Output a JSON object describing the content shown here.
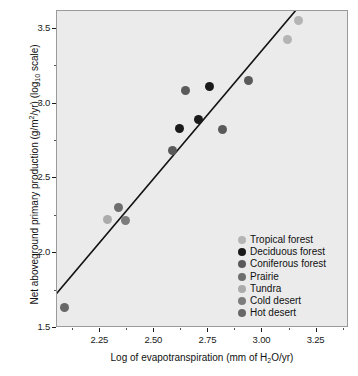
{
  "chart_data": {
    "type": "scatter",
    "title": "",
    "xlabel": "Log of evapotranspiration (mm of H2O/yr)",
    "ylabel": "Net aboveground primary production (g/m2/yr) (log10 scale)",
    "xlim": [
      2.05,
      3.4
    ],
    "ylim": [
      1.5,
      3.62
    ],
    "xticks": [
      "2.25",
      "2.50",
      "2.75",
      "3.00",
      "3.25"
    ],
    "xtick_values": [
      2.25,
      2.5,
      2.75,
      3.0,
      3.25
    ],
    "yticks": [
      "1.5",
      "2.0",
      "2.5",
      "3.0",
      "3.5"
    ],
    "ytick_values": [
      1.5,
      2.0,
      2.5,
      3.0,
      3.5
    ],
    "grid": false,
    "legend_position": "lower-right-inside",
    "trendline": {
      "type": "linear",
      "x_start": 2.05,
      "y_start": 1.72,
      "x_end": 3.16,
      "y_end": 3.62
    },
    "series": [
      {
        "name": "Tropical forest",
        "color": "#b4b4b4",
        "points": [
          {
            "x": 3.12,
            "y": 3.42
          },
          {
            "x": 3.17,
            "y": 3.55
          }
        ]
      },
      {
        "name": "Deciduous forest",
        "color": "#1a1a1a",
        "points": [
          {
            "x": 2.62,
            "y": 2.83
          },
          {
            "x": 2.71,
            "y": 2.89
          },
          {
            "x": 2.76,
            "y": 3.11
          }
        ]
      },
      {
        "name": "Coniferous forest",
        "color": "#5a5a5a",
        "points": [
          {
            "x": 2.59,
            "y": 2.68
          },
          {
            "x": 2.65,
            "y": 3.08
          },
          {
            "x": 2.82,
            "y": 2.82
          },
          {
            "x": 2.94,
            "y": 3.15
          }
        ]
      },
      {
        "name": "Prairie",
        "color": "#6e6e6e",
        "points": [
          {
            "x": 2.34,
            "y": 2.3
          }
        ]
      },
      {
        "name": "Tundra",
        "color": "#ababab",
        "points": [
          {
            "x": 2.29,
            "y": 2.22
          }
        ]
      },
      {
        "name": "Cold desert",
        "color": "#7c7c7c",
        "points": [
          {
            "x": 2.37,
            "y": 2.21
          }
        ]
      },
      {
        "name": "Hot desert",
        "color": "#686868",
        "points": [
          {
            "x": 2.09,
            "y": 1.63
          }
        ]
      }
    ]
  },
  "axes": {
    "x_title_parts": {
      "pre": "Log of evapotranspiration (mm of H",
      "sub": "2",
      "post": "O/yr)"
    },
    "y_title_parts": {
      "pre": "Net aboveground primary production (g/m",
      "sup": "2",
      "mid": "/yr) (log",
      "sub": "10",
      "post": " scale)"
    }
  },
  "legend": {
    "items": [
      {
        "label": "Tropical forest",
        "color": "#b4b4b4"
      },
      {
        "label": "Deciduous forest",
        "color": "#1a1a1a"
      },
      {
        "label": "Coniferous forest",
        "color": "#5a5a5a"
      },
      {
        "label": "Prairie",
        "color": "#6e6e6e"
      },
      {
        "label": "Tundra",
        "color": "#ababab"
      },
      {
        "label": "Cold desert",
        "color": "#7c7c7c"
      },
      {
        "label": "Hot desert",
        "color": "#686868"
      }
    ]
  }
}
